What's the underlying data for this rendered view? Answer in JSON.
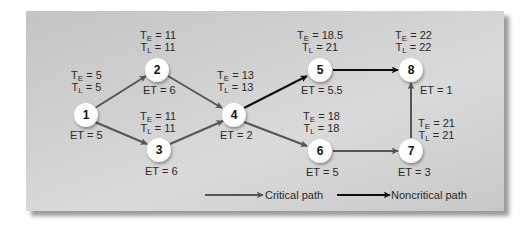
{
  "diagram": {
    "type": "PERT network",
    "nodes": [
      {
        "id": "1",
        "te": "5",
        "tl": "5",
        "et": "5"
      },
      {
        "id": "2",
        "te": "11",
        "tl": "11",
        "et": "6"
      },
      {
        "id": "3",
        "te": "11",
        "tl": "11",
        "et": "6"
      },
      {
        "id": "4",
        "te": "13",
        "tl": "13",
        "et": "2"
      },
      {
        "id": "5",
        "te": "18.5",
        "tl": "21",
        "et": "5.5"
      },
      {
        "id": "6",
        "te": "18",
        "tl": "18",
        "et": "5"
      },
      {
        "id": "7",
        "te": "21",
        "tl": "21",
        "et": "3"
      },
      {
        "id": "8",
        "te": "22",
        "tl": "22",
        "et": "1"
      }
    ],
    "edges": [
      {
        "from": "1",
        "to": "2",
        "type": "critical"
      },
      {
        "from": "1",
        "to": "3",
        "type": "critical"
      },
      {
        "from": "2",
        "to": "4",
        "type": "critical"
      },
      {
        "from": "3",
        "to": "4",
        "type": "critical"
      },
      {
        "from": "4",
        "to": "5",
        "type": "noncritical"
      },
      {
        "from": "4",
        "to": "6",
        "type": "critical"
      },
      {
        "from": "5",
        "to": "8",
        "type": "noncritical"
      },
      {
        "from": "6",
        "to": "7",
        "type": "critical"
      },
      {
        "from": "7",
        "to": "8",
        "type": "critical"
      }
    ],
    "labels": {
      "te_prefix": "T",
      "te_sub": "E",
      "tl_prefix": "T",
      "tl_sub": "L",
      "eq": " = ",
      "et_prefix": "ET = "
    },
    "legend": {
      "critical_label": "Critical path",
      "noncritical_label": "Noncritical path"
    },
    "colors": {
      "critical": "#555555",
      "noncritical": "#0d0d0d",
      "background": "#cfcfcf"
    }
  },
  "text": {
    "n1": {
      "id": "1",
      "te": "Tₑ = 5"
    },
    "n1_te": "5",
    "n1_tl": "5",
    "n1_et": "ET = 5",
    "n2_te": "11",
    "n2_tl": "11",
    "n2_et": "ET = 6",
    "n3_te": "11",
    "n3_tl": "11",
    "n3_et": "ET = 6",
    "n4_te": "13",
    "n4_tl": "13",
    "n4_et": "ET = 2",
    "n5_te": "18.5",
    "n5_tl": "21",
    "n5_et": "ET = 5.5",
    "n6_te": "18",
    "n6_tl": "18",
    "n6_et": "ET = 5",
    "n7_te": "21",
    "n7_tl": "21",
    "n7_et": "ET = 3",
    "n8_te": "22",
    "n8_tl": "22",
    "n8_et": "ET = 1",
    "ids": [
      "1",
      "2",
      "3",
      "4",
      "5",
      "6",
      "7",
      "8"
    ],
    "T": "T",
    "E": "E",
    "L": "L",
    "eq": " = "
  }
}
